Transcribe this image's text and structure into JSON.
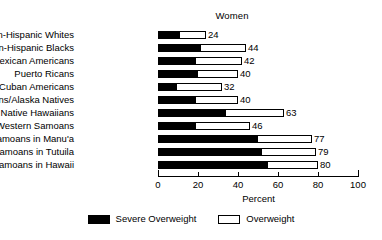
{
  "chart_data": {
    "type": "bar",
    "orientation": "horizontal",
    "stacked": true,
    "title": "Women",
    "xlabel": "Percent",
    "ylabel": "",
    "xlim": [
      0,
      100
    ],
    "xticks": [
      0,
      20,
      40,
      60,
      80,
      100
    ],
    "grid": false,
    "legend_position": "bottom-center",
    "categories": [
      "Non-Hispanic Whites",
      "Non-Hispanic Blacks",
      "Mexican Americans",
      "Puerto Ricans",
      "Cuban Americans",
      "American Indians/Alaska Natives",
      "Native Hawaiians",
      "Western Samoans",
      "Samoans in Manu'a",
      "Samoans in Tutuila",
      "Samoans in Hawaii"
    ],
    "series": [
      {
        "name": "Severe Overweight",
        "color": "#000000",
        "values": [
          11,
          21.5,
          19,
          20,
          9.5,
          19,
          34,
          19,
          50,
          52,
          55
        ]
      },
      {
        "name": "Overweight",
        "color": "#ffffff",
        "values": [
          13,
          22.5,
          23,
          20,
          22.5,
          21,
          29,
          27,
          27,
          27,
          25
        ]
      }
    ],
    "totals": [
      24,
      44,
      42,
      40,
      32,
      40,
      63,
      46,
      77,
      79,
      80
    ],
    "total_labels": [
      "24",
      "44",
      "42",
      "40",
      "32",
      "40",
      "63",
      "46",
      "77",
      "79",
      "80"
    ],
    "tick_labels": [
      "0",
      "20",
      "40",
      "60",
      "80",
      "100"
    ]
  },
  "legend": {
    "items": [
      {
        "label": "Severe Overweight",
        "swatch": "filled-black-swatch"
      },
      {
        "label": "Overweight",
        "swatch": "outline-white-swatch"
      }
    ]
  },
  "colors": {
    "severe": "#000000",
    "overweight": "#ffffff",
    "axis": "#000000",
    "background": "#ffffff"
  }
}
